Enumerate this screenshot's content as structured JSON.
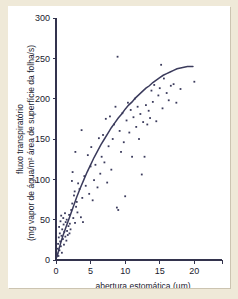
{
  "figure": {
    "background_color": "#efe9d8",
    "panel_color": "#ffffff",
    "ink_color": "#3b3b5c"
  },
  "chart_data": {
    "type": "scatter",
    "title": "",
    "subtitle": "",
    "xlabel": "abertura estomática (µm)",
    "ylabel_line1": "fluxo transpiratório",
    "ylabel_line2": "(mg vapor de água/m² área de superfície da folha/s)",
    "xlim": [
      0,
      24
    ],
    "ylim": [
      0,
      300
    ],
    "xticks": [
      0,
      5,
      10,
      15,
      20
    ],
    "yticks": [
      0,
      50,
      100,
      150,
      200,
      250,
      300
    ],
    "xtick_labels": [
      "0",
      "5",
      "10",
      "15",
      "20"
    ],
    "ytick_labels": [
      "0",
      "50",
      "100",
      "150",
      "200",
      "250",
      "300"
    ],
    "grid": false,
    "legend": null,
    "legend_position": "none",
    "series": [
      {
        "name": "observações",
        "type": "scatter",
        "marker": "dot",
        "color": "#3b3b5c",
        "points": [
          [
            0.2,
            8
          ],
          [
            0.25,
            14
          ],
          [
            0.3,
            20
          ],
          [
            0.35,
            5
          ],
          [
            0.4,
            28
          ],
          [
            0.45,
            41
          ],
          [
            0.5,
            12
          ],
          [
            0.55,
            33
          ],
          [
            0.6,
            23
          ],
          [
            0.65,
            48
          ],
          [
            0.7,
            17
          ],
          [
            0.75,
            55
          ],
          [
            0.8,
            30
          ],
          [
            0.85,
            9
          ],
          [
            0.9,
            38
          ],
          [
            1.0,
            26
          ],
          [
            1.05,
            52
          ],
          [
            1.1,
            44
          ],
          [
            1.15,
            19
          ],
          [
            1.2,
            35
          ],
          [
            1.3,
            58
          ],
          [
            1.35,
            29
          ],
          [
            1.4,
            47
          ],
          [
            1.5,
            24
          ],
          [
            1.55,
            50
          ],
          [
            1.6,
            36
          ],
          [
            1.7,
            31
          ],
          [
            1.8,
            42
          ],
          [
            1.9,
            56
          ],
          [
            1.95,
            33
          ],
          [
            2.0,
            45
          ],
          [
            2.1,
            38
          ],
          [
            2.2,
            62
          ],
          [
            2.3,
            98
          ],
          [
            2.35,
            70
          ],
          [
            2.4,
            109
          ],
          [
            2.5,
            52
          ],
          [
            2.6,
            80
          ],
          [
            2.7,
            85
          ],
          [
            2.75,
            46
          ],
          [
            2.8,
            134
          ],
          [
            2.9,
            66
          ],
          [
            3.0,
            72
          ],
          [
            3.1,
            59
          ],
          [
            3.2,
            95
          ],
          [
            3.4,
            88
          ],
          [
            3.6,
            53
          ],
          [
            3.7,
            161
          ],
          [
            3.8,
            77
          ],
          [
            3.9,
            47
          ],
          [
            4.1,
            104
          ],
          [
            4.3,
            92
          ],
          [
            4.6,
            130
          ],
          [
            4.8,
            82
          ],
          [
            5.0,
            116
          ],
          [
            5.1,
            140
          ],
          [
            5.3,
            74
          ],
          [
            5.5,
            99
          ],
          [
            5.7,
            118
          ],
          [
            6.0,
            90
          ],
          [
            6.2,
            151
          ],
          [
            6.4,
            107
          ],
          [
            6.6,
            128
          ],
          [
            6.8,
            155
          ],
          [
            7.0,
            121
          ],
          [
            7.2,
            175
          ],
          [
            7.4,
            96
          ],
          [
            7.6,
            141
          ],
          [
            7.8,
            178
          ],
          [
            8.0,
            112
          ],
          [
            8.2,
            150
          ],
          [
            8.4,
            168
          ],
          [
            8.6,
            190
          ],
          [
            8.8,
            65
          ],
          [
            8.9,
            252
          ],
          [
            9.0,
            62
          ],
          [
            9.2,
            160
          ],
          [
            9.4,
            134
          ],
          [
            9.6,
            182
          ],
          [
            9.8,
            146
          ],
          [
            10.0,
            79
          ],
          [
            10.2,
            173
          ],
          [
            10.4,
            195
          ],
          [
            10.6,
            158
          ],
          [
            10.8,
            186
          ],
          [
            11.0,
            128
          ],
          [
            11.2,
            177
          ],
          [
            11.4,
            200
          ],
          [
            11.6,
            165
          ],
          [
            11.8,
            190
          ],
          [
            12.0,
            150
          ],
          [
            12.2,
            181
          ],
          [
            12.4,
            106
          ],
          [
            12.6,
            171
          ],
          [
            12.8,
            128
          ],
          [
            13.0,
            192
          ],
          [
            13.2,
            168
          ],
          [
            13.4,
            185
          ],
          [
            13.6,
            176
          ],
          [
            13.8,
            210
          ],
          [
            14.0,
            196
          ],
          [
            14.2,
            217
          ],
          [
            14.5,
            172
          ],
          [
            14.8,
            204
          ],
          [
            15.0,
            213
          ],
          [
            15.2,
            242
          ],
          [
            15.4,
            188
          ],
          [
            15.6,
            225
          ],
          [
            16.0,
            207
          ],
          [
            16.3,
            198
          ],
          [
            16.6,
            216
          ],
          [
            17.0,
            218
          ],
          [
            17.4,
            195
          ],
          [
            18.0,
            212
          ],
          [
            20.0,
            221
          ]
        ]
      },
      {
        "name": "curva ajustada",
        "type": "line",
        "color": "#3b3b5c",
        "points": [
          [
            0.15,
            4
          ],
          [
            0.5,
            16
          ],
          [
            1.0,
            30
          ],
          [
            1.5,
            42
          ],
          [
            2.0,
            54
          ],
          [
            2.5,
            66
          ],
          [
            3.0,
            78
          ],
          [
            3.5,
            89
          ],
          [
            4.0,
            99
          ],
          [
            4.5,
            109
          ],
          [
            5.0,
            118
          ],
          [
            5.5,
            127
          ],
          [
            6.0,
            135
          ],
          [
            6.5,
            143
          ],
          [
            7.0,
            150
          ],
          [
            7.5,
            157
          ],
          [
            8.0,
            164
          ],
          [
            8.5,
            170
          ],
          [
            9.0,
            176
          ],
          [
            9.5,
            181
          ],
          [
            10.0,
            187
          ],
          [
            10.5,
            192
          ],
          [
            11.0,
            196
          ],
          [
            11.5,
            201
          ],
          [
            12.0,
            205
          ],
          [
            12.5,
            209
          ],
          [
            13.0,
            213
          ],
          [
            13.5,
            216
          ],
          [
            14.0,
            220
          ],
          [
            14.5,
            223
          ],
          [
            15.0,
            226
          ],
          [
            15.5,
            229
          ],
          [
            16.0,
            231
          ],
          [
            16.5,
            233
          ],
          [
            17.0,
            235
          ],
          [
            17.5,
            237
          ],
          [
            18.0,
            238
          ],
          [
            18.5,
            239
          ],
          [
            19.0,
            240
          ],
          [
            19.5,
            240
          ],
          [
            19.8,
            240
          ]
        ]
      }
    ]
  }
}
